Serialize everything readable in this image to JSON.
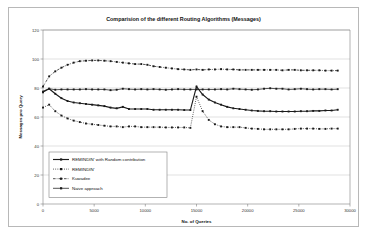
{
  "chart_data": {
    "type": "line",
    "title": "Comparision of the different Routing Algorithms (Messages)",
    "xlabel": "No. of Queries",
    "ylabel": "Messages pro Query",
    "xlim": [
      0,
      30000
    ],
    "ylim": [
      0,
      120
    ],
    "xticks": [
      0,
      5000,
      10000,
      15000,
      20000,
      25000,
      30000
    ],
    "xtick_labels": [
      "0",
      "5000",
      "10000",
      "15000",
      "20000",
      "25000",
      "30000"
    ],
    "yticks": [
      0,
      20,
      40,
      60,
      80,
      100,
      120
    ],
    "ytick_labels": [
      "0",
      "20",
      "40",
      "60",
      "80",
      "100",
      "120"
    ],
    "grid": "horizontal",
    "legend_position": "lower-left",
    "x": [
      0,
      600,
      1200,
      1800,
      2400,
      3000,
      3600,
      4200,
      4800,
      5400,
      6000,
      6600,
      7200,
      7800,
      8400,
      9000,
      9600,
      10200,
      10800,
      11400,
      12000,
      12600,
      13200,
      13800,
      14400,
      15000,
      15600,
      16200,
      16800,
      17400,
      18000,
      18600,
      19200,
      19800,
      20400,
      21000,
      21600,
      22200,
      22800,
      23400,
      24000,
      24600,
      25200,
      25800,
      26400,
      27000,
      27600,
      28200,
      28800
    ],
    "series": [
      {
        "name": "REMINDIN' with Random contribution",
        "line_style": "solid",
        "marker": "square",
        "color": "#1a1a1a",
        "values": [
          77.5,
          79.5,
          76.0,
          73.0,
          71.0,
          70.0,
          69.5,
          69.0,
          68.5,
          68.0,
          67.5,
          66.5,
          66.0,
          67.0,
          65.5,
          65.5,
          65.5,
          65.5,
          65.0,
          65.0,
          65.0,
          65.0,
          65.0,
          64.8,
          64.8,
          81.0,
          75.5,
          72.0,
          70.0,
          68.5,
          67.0,
          66.0,
          65.5,
          65.0,
          64.5,
          64.2,
          64.0,
          64.0,
          63.8,
          63.8,
          63.8,
          63.8,
          64.0,
          64.0,
          64.2,
          64.2,
          64.5,
          64.5,
          65.0
        ]
      },
      {
        "name": "REMINDIN'",
        "line_style": "dotted",
        "marker": "square",
        "color": "#1a1a1a",
        "values": [
          66.5,
          68.5,
          64.0,
          61.0,
          59.0,
          57.5,
          56.5,
          55.5,
          55.0,
          54.5,
          54.0,
          53.5,
          53.5,
          53.0,
          53.5,
          53.5,
          53.0,
          53.0,
          53.0,
          53.0,
          52.8,
          52.8,
          52.8,
          52.8,
          52.5,
          74.0,
          64.0,
          58.0,
          55.0,
          53.5,
          53.0,
          53.0,
          53.0,
          52.5,
          52.0,
          51.8,
          51.5,
          51.5,
          51.5,
          51.5,
          51.5,
          51.8,
          52.0,
          52.0,
          52.0,
          51.8,
          51.8,
          52.0,
          52.0
        ]
      },
      {
        "name": "Kuwadee",
        "line_style": "dash-dot",
        "marker": "square",
        "color": "#1a1a1a",
        "values": [
          81.0,
          88.0,
          91.5,
          94.0,
          96.0,
          97.5,
          98.5,
          98.8,
          99.0,
          99.0,
          98.8,
          98.5,
          98.0,
          97.5,
          97.0,
          96.5,
          96.5,
          96.0,
          95.0,
          94.5,
          94.0,
          93.5,
          93.0,
          92.8,
          92.5,
          92.8,
          92.5,
          92.8,
          92.8,
          93.0,
          92.8,
          92.8,
          92.5,
          92.5,
          92.5,
          92.5,
          92.5,
          92.5,
          92.5,
          92.2,
          92.5,
          92.5,
          92.2,
          92.2,
          92.2,
          92.2,
          92.0,
          92.0,
          92.0
        ]
      },
      {
        "name": "Naive approach",
        "line_style": "solid-thin",
        "marker": "square",
        "color": "#1a1a1a",
        "values": [
          77.0,
          79.5,
          78.8,
          79.0,
          79.0,
          79.0,
          79.0,
          79.2,
          79.0,
          79.0,
          79.0,
          78.5,
          78.8,
          79.5,
          79.2,
          79.0,
          79.2,
          79.0,
          79.2,
          79.0,
          78.8,
          79.0,
          79.2,
          79.0,
          79.0,
          79.0,
          79.0,
          79.0,
          79.0,
          79.2,
          79.0,
          79.5,
          79.2,
          79.0,
          78.8,
          79.0,
          79.5,
          79.8,
          79.5,
          79.5,
          79.0,
          79.2,
          79.5,
          79.2,
          79.0,
          79.2,
          79.2,
          79.0,
          79.2
        ]
      }
    ]
  }
}
